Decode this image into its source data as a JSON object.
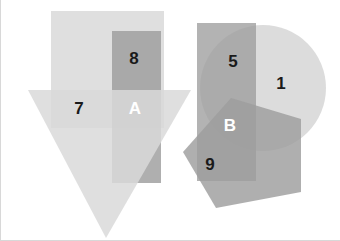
{
  "figure": {
    "background_color": "#ffffff",
    "width": 340,
    "height": 241,
    "border_color": "#d8d8d8"
  },
  "palette": {
    "light_gray": "#d9d9d9",
    "medium_gray": "#a0a0a0",
    "dark_gray": "#7a7a7a",
    "label_dark": "#1a1a1a",
    "label_light": "#ffffff"
  },
  "shapes": [
    {
      "id": "left-square",
      "kind": "rect",
      "fill": "#d9d9d9",
      "opacity": 0.85,
      "x": 50,
      "y": 11,
      "w": 113,
      "h": 117
    },
    {
      "id": "left-vertical-rect",
      "kind": "rect",
      "fill": "#9e9e9e",
      "opacity": 0.85,
      "x": 111,
      "y": 31,
      "w": 49,
      "h": 152
    },
    {
      "id": "left-triangle",
      "kind": "polygon",
      "fill": "#d9d9d9",
      "opacity": 0.85,
      "points": "27,90 190,90 105,238"
    },
    {
      "id": "right-circle",
      "kind": "circle",
      "fill": "#d9d9d9",
      "opacity": 0.9,
      "cx": 262,
      "cy": 88,
      "r": 63
    },
    {
      "id": "right-vertical-rect",
      "kind": "rect",
      "fill": "#9e9e9e",
      "opacity": 0.8,
      "x": 196,
      "y": 23,
      "w": 59,
      "h": 158
    },
    {
      "id": "right-pentagon",
      "kind": "polygon",
      "fill": "#9e9e9e",
      "opacity": 0.85,
      "points": "230,98 300,119 300,192 215,208 182,152"
    }
  ],
  "labels": [
    {
      "id": "label-8",
      "text": "8",
      "x": 133,
      "y": 58,
      "tone": "dark"
    },
    {
      "id": "label-7",
      "text": "7",
      "x": 78,
      "y": 108,
      "tone": "dark"
    },
    {
      "id": "label-A",
      "text": "A",
      "x": 134,
      "y": 108,
      "tone": "light"
    },
    {
      "id": "label-5",
      "text": "5",
      "x": 232,
      "y": 61,
      "tone": "dark"
    },
    {
      "id": "label-1",
      "text": "1",
      "x": 280,
      "y": 83,
      "tone": "dark"
    },
    {
      "id": "label-B",
      "text": "B",
      "x": 229,
      "y": 125,
      "tone": "light"
    },
    {
      "id": "label-9",
      "text": "9",
      "x": 209,
      "y": 164,
      "tone": "dark"
    }
  ],
  "chart_data": {
    "type": "diagram",
    "clusters": [
      {
        "name": "left-cluster",
        "shapes": [
          "square",
          "vertical-rectangle",
          "downward-triangle"
        ],
        "regions": [
          {
            "label": "8",
            "members": [
              "square",
              "vertical-rectangle"
            ]
          },
          {
            "label": "7",
            "members": [
              "square",
              "downward-triangle"
            ]
          },
          {
            "label": "A",
            "members": [
              "square",
              "vertical-rectangle",
              "downward-triangle"
            ]
          }
        ]
      },
      {
        "name": "right-cluster",
        "shapes": [
          "circle",
          "vertical-rectangle",
          "pentagon"
        ],
        "regions": [
          {
            "label": "5",
            "members": [
              "circle",
              "vertical-rectangle"
            ]
          },
          {
            "label": "1",
            "members": [
              "circle"
            ]
          },
          {
            "label": "B",
            "members": [
              "circle",
              "vertical-rectangle",
              "pentagon"
            ]
          },
          {
            "label": "9",
            "members": [
              "vertical-rectangle",
              "pentagon"
            ]
          }
        ]
      }
    ],
    "label_values": [
      "8",
      "7",
      "A",
      "5",
      "1",
      "B",
      "9"
    ]
  }
}
